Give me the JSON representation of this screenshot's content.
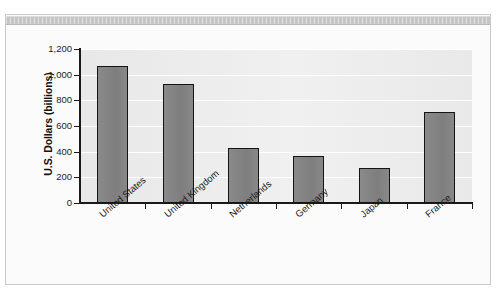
{
  "chart_data": {
    "type": "bar",
    "title": "",
    "subtitle": "",
    "xlabel": "",
    "ylabel": "U.S. Dollars (billions)",
    "categories": [
      "United States",
      "United Kingdom",
      "Netherlands",
      "Germany",
      "Japan",
      "France"
    ],
    "values": [
      1070,
      925,
      430,
      365,
      275,
      710
    ],
    "ylim": [
      0,
      1200
    ],
    "ytick_values": [
      0,
      200,
      400,
      600,
      800,
      1000,
      1200
    ],
    "ytick_labels": [
      "0",
      "200",
      "400",
      "600",
      "800",
      "1,000",
      "1,200"
    ],
    "grid": "horizontal",
    "legend": "none",
    "series": [
      {
        "name": "U.S. Dollars (billions)",
        "values": [
          1070,
          925,
          430,
          365,
          275,
          710
        ]
      }
    ],
    "colors": {
      "bar_fill": "#838383",
      "bar_border": "#141414",
      "plot_background": "#ededed",
      "gridline": "#ffffff",
      "axis": "#1a1a1a",
      "text": "#1b1b1b",
      "figure_background": "#fbfbfb",
      "top_band": "#c6c6c6"
    }
  }
}
